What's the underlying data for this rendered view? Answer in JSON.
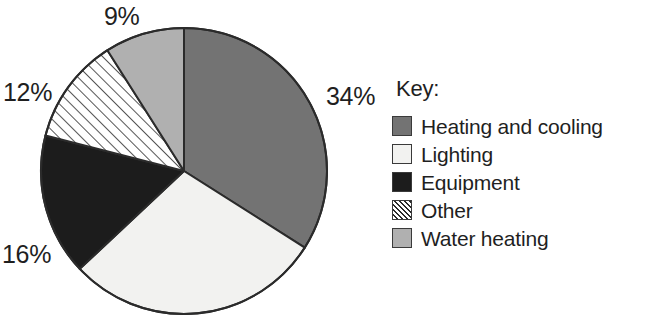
{
  "legend": {
    "title": "Key:",
    "items": [
      {
        "label": "Heating and cooling",
        "swatch": "solid",
        "color": "#737373"
      },
      {
        "label": "Lighting",
        "swatch": "solid",
        "color": "#f2f2f0"
      },
      {
        "label": "Equipment",
        "swatch": "solid",
        "color": "#1c1c1c"
      },
      {
        "label": "Other",
        "swatch": "hatch",
        "color": "#ffffff"
      },
      {
        "label": "Water heating",
        "swatch": "solid",
        "color": "#b0b0b0"
      }
    ]
  },
  "labels": {
    "pct_34": "34%",
    "pct_16": "16%",
    "pct_12": "12%",
    "pct_9": "9%"
  },
  "chart_data": {
    "type": "pie",
    "title": "",
    "categories": [
      "Heating and cooling",
      "Lighting",
      "Equipment",
      "Other",
      "Water heating"
    ],
    "values": [
      34,
      29,
      16,
      12,
      9
    ],
    "value_labels": [
      "34%",
      "",
      "16%",
      "12%",
      "9%"
    ],
    "colors": [
      "#737373",
      "#f2f2f0",
      "#1c1c1c",
      "#ffffff",
      "#b0b0b0"
    ],
    "patterns": [
      "solid",
      "solid",
      "solid",
      "diagonal-hatch",
      "solid"
    ],
    "start_angle_deg": 0,
    "direction": "clockwise",
    "legend_position": "right",
    "legend_title": "Key:",
    "units": "percent",
    "total": 100
  }
}
